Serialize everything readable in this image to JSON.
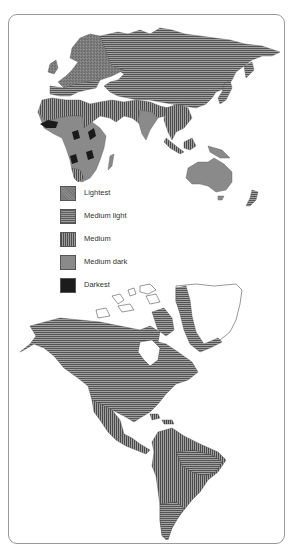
{
  "figure": {
    "type": "skin pigmentation distribution world map",
    "panels": [
      "Eastern Hemisphere (Europe, Asia, Africa, Oceania)",
      "Western Hemisphere (North & South America)"
    ]
  },
  "legend": {
    "items": [
      {
        "label": "Lightest",
        "pattern": "stipple",
        "color": "#7c7c7c"
      },
      {
        "label": "Medium light",
        "pattern": "horizontal-lines",
        "color": "#6e6e6e"
      },
      {
        "label": "Medium",
        "pattern": "vertical-lines",
        "color": "#6a6a6a"
      },
      {
        "label": "Medium dark",
        "pattern": "solid",
        "color": "#8a8a8a"
      },
      {
        "label": "Darkest",
        "pattern": "solid",
        "color": "#1c1c1c"
      }
    ]
  },
  "regions": {
    "lightest": [
      "Northern Europe"
    ],
    "medium_light": [
      "Northern Asia",
      "Southern Europe",
      "East Asia",
      "North America (native)",
      "Greenland coast",
      "Southern South America"
    ],
    "medium": [
      "North Africa",
      "Middle East",
      "Southeast Asia",
      "Central America",
      "Amazon basin",
      "Mexico"
    ],
    "medium_dark": [
      "Sub-Saharan Africa",
      "India",
      "Australia",
      "Melanesia"
    ],
    "darkest": [
      "West Africa patches",
      "Central Africa patches"
    ]
  },
  "colors": {
    "frame": "#9a9a9a",
    "background": "#ffffff",
    "outline": "#333333"
  }
}
